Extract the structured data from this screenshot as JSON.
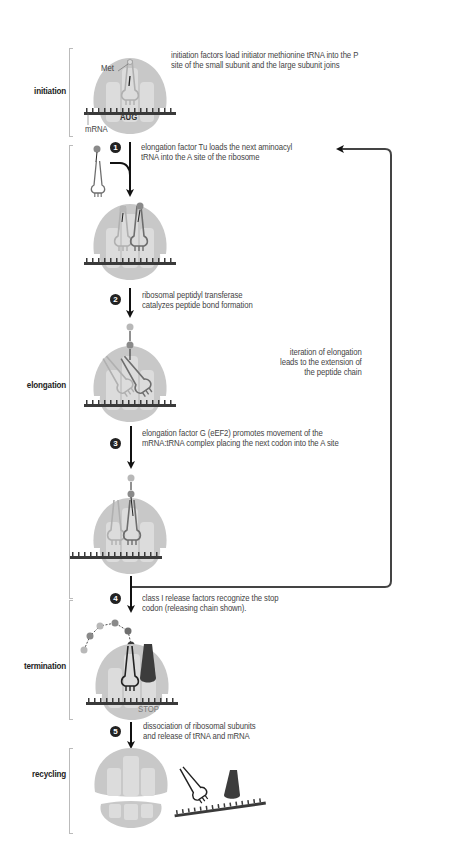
{
  "stages": [
    {
      "label": "initiation"
    },
    {
      "label": "elongation"
    },
    {
      "label": "termination"
    },
    {
      "label": "recycling"
    }
  ],
  "labels": {
    "met": "Met",
    "aug": "AUG",
    "mrna": "mRNA",
    "stop": "STOP"
  },
  "steps": [
    {
      "number": "",
      "lines": [
        "initiation factors load initiator methionine tRNA into the P",
        "site of the small subunit and the large subunit joins"
      ]
    },
    {
      "number": "1",
      "lines": [
        "elongation factor Tu loads the next aminoacyl",
        "tRNA into the A site of the ribosome"
      ]
    },
    {
      "number": "2",
      "lines": [
        "ribosomal peptidyl transferase",
        "catalyzes peptide bond formation"
      ]
    },
    {
      "number": "3",
      "lines": [
        "elongation factor G (eEF2) promotes movement of the",
        "mRNA:tRNA complex placing the next codon into the A site"
      ]
    },
    {
      "number": "4",
      "lines": [
        "class I release factors recognize the stop",
        "codon (releasing chain shown)."
      ]
    },
    {
      "number": "5",
      "lines": [
        "dissociation of ribosomal subunits",
        "and release of tRNA and mRNA"
      ]
    }
  ],
  "loop_note": {
    "lines": [
      "iteration of elongation",
      "leads to the extension of",
      "the peptide chain"
    ]
  },
  "colors": {
    "ribosome_outer": "#c8c8c8",
    "ribosome_inner": "#dcdcdc",
    "mrna": "#3a3a3a",
    "trna_light": "#b0b0b0",
    "trna_dark": "#6e6e6e",
    "amino_light": "#b8b8b8",
    "amino_mid": "#8a8a8a",
    "amino_dark": "#3c3c3c",
    "arrow": "#111111",
    "loop": "#444444"
  }
}
